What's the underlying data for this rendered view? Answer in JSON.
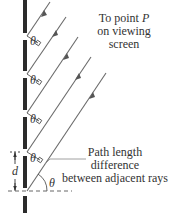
{
  "diagram": {
    "labels": {
      "screen_line1": "To point ",
      "screen_point": "P",
      "screen_line2": "on viewing",
      "screen_line3": "screen",
      "path_line1": "Path length",
      "path_line2": "difference",
      "path_line3": "between adjacent rays",
      "spacing": "d",
      "angle": "θ"
    },
    "slit_y": [
      36,
      74,
      113,
      152,
      191
    ],
    "colors": {
      "barrier": "#2b2b2b",
      "ray": "#6a6a6a",
      "text": "#333333"
    }
  }
}
